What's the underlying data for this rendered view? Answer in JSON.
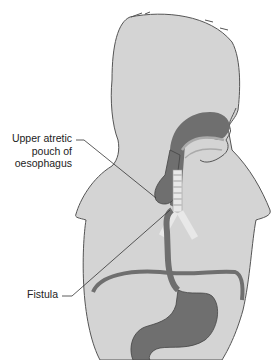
{
  "diagram": {
    "labels": {
      "pouch_line1": "Upper atretic",
      "pouch_line2": "pouch of",
      "pouch_line3": "oesophagus",
      "fistula": "Fistula"
    },
    "colors": {
      "body_fill": "#d4d4d4",
      "outline": "#555555",
      "organ_dark": "#6f6f6f",
      "organ_mid": "#8a8a8a",
      "trachea_light": "#e8e8e8",
      "leader_line": "#333333"
    }
  }
}
